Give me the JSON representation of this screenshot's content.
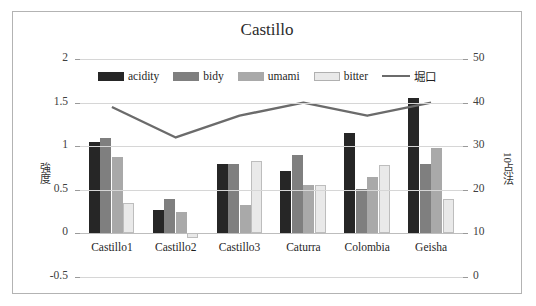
{
  "top_strip_text": "",
  "chart_title": "Castillo",
  "axis": {
    "left_label": "強度",
    "right_label": "10点法",
    "left_ticks": [
      "2",
      "1.5",
      "1",
      "0.5",
      "0",
      "-0.5"
    ],
    "right_ticks": [
      "50",
      "40",
      "30",
      "20",
      "10",
      "0"
    ]
  },
  "legend": [
    {
      "label": "acidity",
      "color": "#262626",
      "type": "swatch"
    },
    {
      "label": "bidy",
      "color": "#7f7f7f",
      "type": "swatch"
    },
    {
      "label": "umami",
      "color": "#a9a9a9",
      "type": "swatch"
    },
    {
      "label": "bitter",
      "color": "#e9e9e9",
      "type": "swatch"
    },
    {
      "label": "堀口",
      "color": "#6b6b6b",
      "type": "line"
    }
  ],
  "chart_data": {
    "type": "bar",
    "title": "Castillo",
    "xlabel": "",
    "ylabel": "強度",
    "y2label": "10点法",
    "ylim": [
      -0.5,
      2
    ],
    "y2lim": [
      0,
      50
    ],
    "grid": true,
    "legend_position": "top",
    "categories": [
      "Castillo1",
      "Castillo2",
      "Castillo3",
      "Caturra",
      "Colombia",
      "Geisha"
    ],
    "series": [
      {
        "name": "acidity",
        "type": "bar",
        "axis": "left",
        "color": "#262626",
        "values": [
          1.05,
          0.27,
          0.8,
          0.72,
          1.15,
          1.55
        ]
      },
      {
        "name": "bidy",
        "type": "bar",
        "axis": "left",
        "color": "#7f7f7f",
        "values": [
          1.1,
          0.4,
          0.8,
          0.9,
          0.51,
          0.8
        ]
      },
      {
        "name": "umami",
        "type": "bar",
        "axis": "left",
        "color": "#a9a9a9",
        "values": [
          0.88,
          0.24,
          0.33,
          0.55,
          0.65,
          0.98
        ]
      },
      {
        "name": "bitter",
        "type": "bar",
        "axis": "left",
        "color": "#e9e9e9",
        "values": [
          0.35,
          -0.05,
          0.83,
          0.55,
          0.78,
          0.39
        ]
      },
      {
        "name": "堀口",
        "type": "line",
        "axis": "right",
        "color": "#6b6b6b",
        "values": [
          39,
          32,
          37,
          40,
          37,
          40
        ]
      }
    ]
  }
}
